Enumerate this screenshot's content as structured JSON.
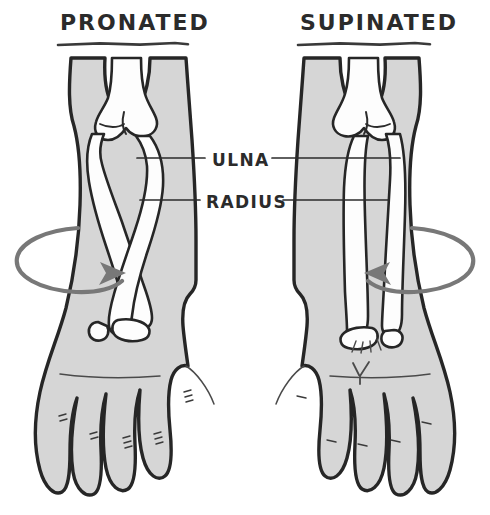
{
  "figure": {
    "title_left": "PRONATED",
    "title_right": "SUPINATED",
    "label_ulna": "ULNA",
    "label_radius": "RADIUS",
    "background_color": "#ffffff",
    "limb_fill_color": "#d6d6d6",
    "bone_fill_color": "#fdfdfd",
    "ink_color": "#262626",
    "arrow_color": "#787878"
  },
  "panels": [
    {
      "id": "pronated",
      "title": "PRONATED",
      "hand_view": "dorsal",
      "bone_arrangement": "crossed",
      "rotation_direction": "clockwise",
      "arrow_points": "right"
    },
    {
      "id": "supinated",
      "title": "SUPINATED",
      "hand_view": "palmar",
      "bone_arrangement": "parallel",
      "rotation_direction": "counter-clockwise",
      "arrow_points": "left"
    }
  ],
  "labels": [
    {
      "id": "ulna",
      "text": "ULNA"
    },
    {
      "id": "radius",
      "text": "RADIUS"
    }
  ]
}
